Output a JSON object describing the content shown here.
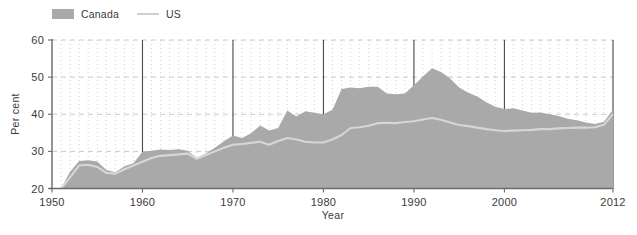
{
  "legend": {
    "items": [
      {
        "label": "Canada",
        "kind": "area-swatch",
        "color": "#a9a9a9"
      },
      {
        "label": "US",
        "kind": "line-swatch",
        "color": "#cfcfcf"
      }
    ]
  },
  "colors": {
    "area_fill": "#a9a9a9",
    "us_line": "#d6d6d6",
    "axis": "#6b6b6b",
    "decade_gridline": "#4a4a4a",
    "minor_gridline": "#c9c9c9",
    "horizontal_gridline": "#bdbdbd",
    "text": "#3b3b3b",
    "background": "#ffffff"
  },
  "chart_data": {
    "type": "area",
    "title": "",
    "subtitle": "",
    "xlabel": "Year",
    "ylabel": "Per cent",
    "xlim": [
      1950,
      2012
    ],
    "ylim": [
      20,
      60
    ],
    "yticks": [
      20,
      30,
      40,
      50,
      60
    ],
    "ytick_labels": [
      "20",
      "30",
      "40",
      "50",
      "60"
    ],
    "xticks": [
      1950,
      1960,
      1970,
      1980,
      1990,
      2000,
      2012
    ],
    "xtick_labels": [
      "1950",
      "1960",
      "1970",
      "1980",
      "1990",
      "2000",
      "2012"
    ],
    "grid": "minor vertical dotted every year, solid vertical at each decade, dashed horizontal at each 10 per cent",
    "legend_position": "top-left",
    "x": [
      1951,
      1952,
      1953,
      1954,
      1955,
      1956,
      1957,
      1958,
      1959,
      1960,
      1961,
      1962,
      1963,
      1964,
      1965,
      1966,
      1967,
      1968,
      1969,
      1970,
      1971,
      1972,
      1973,
      1974,
      1975,
      1976,
      1977,
      1978,
      1979,
      1980,
      1981,
      1982,
      1983,
      1984,
      1985,
      1986,
      1987,
      1988,
      1989,
      1990,
      1991,
      1992,
      1993,
      1994,
      1995,
      1996,
      1997,
      1998,
      1999,
      2000,
      2001,
      2002,
      2003,
      2004,
      2005,
      2006,
      2007,
      2008,
      2009,
      2010,
      2011,
      2012
    ],
    "series": [
      {
        "name": "Canada",
        "type": "area",
        "color": "#a9a9a9",
        "values": [
          20.0,
          24.5,
          27.4,
          27.6,
          27.3,
          25.0,
          24.4,
          26.0,
          26.8,
          29.9,
          30.2,
          30.5,
          30.4,
          30.6,
          30.2,
          28.2,
          29.4,
          31.0,
          32.7,
          34.3,
          33.6,
          34.9,
          37.0,
          35.6,
          36.3,
          41.0,
          39.4,
          40.8,
          40.4,
          40.0,
          41.2,
          46.8,
          47.2,
          47.0,
          47.4,
          47.4,
          45.6,
          45.4,
          45.6,
          47.8,
          50.2,
          52.4,
          51.4,
          49.6,
          47.2,
          45.8,
          44.8,
          43.2,
          42.0,
          41.4,
          41.6,
          41.0,
          40.4,
          40.5,
          40.0,
          39.5,
          38.8,
          38.4,
          37.8,
          37.4,
          38.0,
          41.2
        ]
      },
      {
        "name": "US",
        "type": "line",
        "color": "#d6d6d6",
        "values": [
          20.0,
          23.0,
          26.2,
          26.4,
          25.8,
          24.2,
          24.0,
          25.2,
          26.2,
          27.2,
          28.2,
          28.8,
          29.0,
          29.2,
          29.4,
          28.0,
          29.0,
          30.0,
          31.0,
          31.8,
          32.0,
          32.3,
          32.6,
          31.8,
          32.8,
          33.6,
          33.2,
          32.6,
          32.4,
          32.4,
          33.2,
          34.4,
          36.3,
          36.5,
          36.9,
          37.6,
          37.7,
          37.6,
          37.9,
          38.1,
          38.6,
          39.0,
          38.5,
          37.8,
          37.1,
          36.8,
          36.4,
          36.0,
          35.7,
          35.5,
          35.6,
          35.7,
          35.8,
          36.0,
          36.0,
          36.2,
          36.3,
          36.4,
          36.4,
          36.5,
          37.2,
          40.0
        ]
      }
    ]
  }
}
